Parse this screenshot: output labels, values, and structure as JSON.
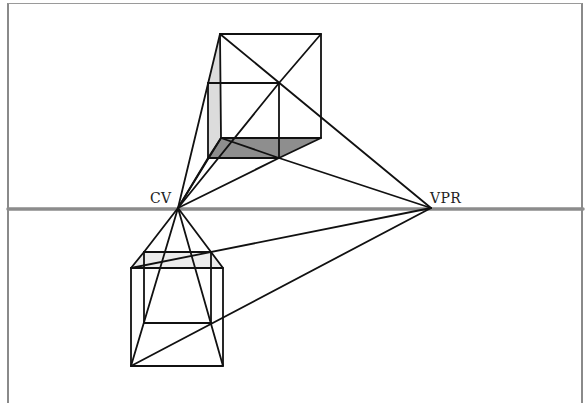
{
  "diagram": {
    "type": "one-point-perspective-construction",
    "labels": {
      "center_of_vision": "CV",
      "vanishing_point_right": "VPR"
    },
    "colors": {
      "line": "#111111",
      "horizon": "#8c8c8c",
      "shade_dark": "#8e8e8e",
      "shade_light": "#dcdcdc",
      "frame": "#8a8a8a"
    },
    "points": {
      "CV": [
        178,
        208
      ],
      "VPR": [
        431,
        208
      ]
    },
    "horizon_y": 209,
    "upper_cube": {
      "front": [
        [
          220,
          34
        ],
        [
          321,
          34
        ],
        [
          321,
          138
        ],
        [
          221,
          138
        ]
      ],
      "back": [
        [
          208,
          83
        ],
        [
          279,
          83
        ],
        [
          279,
          158
        ],
        [
          208,
          158
        ]
      ]
    },
    "lower_cube": {
      "front": [
        [
          131,
          268
        ],
        [
          223,
          268
        ],
        [
          223,
          366
        ],
        [
          131,
          366
        ]
      ],
      "back": [
        [
          144,
          252
        ],
        [
          211,
          252
        ],
        [
          211,
          323
        ],
        [
          144,
          323
        ]
      ]
    }
  }
}
